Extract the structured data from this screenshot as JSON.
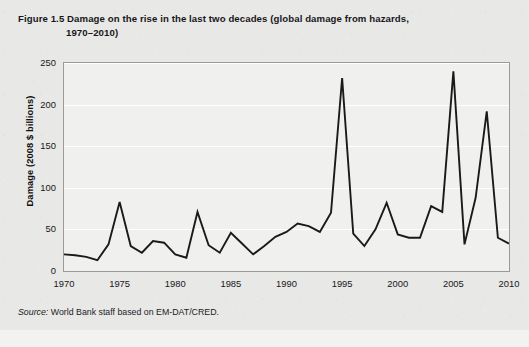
{
  "figure": {
    "number": "Figure 1.5",
    "title_line1": "Damage on the rise in the last two decades (global damage from hazards,",
    "title_line2": "1970–2010)",
    "source_label": "Source:",
    "source_text": " World Bank staff based on EM-DAT/CRED."
  },
  "colors": {
    "page_background": "#e8e8e6",
    "plot_background": "#f0f0ee",
    "line": "#1a1a1a",
    "gridline": "#ffffff",
    "frame": "#9a9a98",
    "text": "#17171a"
  },
  "chart_data": {
    "type": "line",
    "title": "Damage on the rise in the last two decades (global damage from hazards, 1970–2010)",
    "xlabel": "",
    "ylabel": "Damage (2008 $ billions)",
    "xlim": [
      1970,
      2010
    ],
    "ylim": [
      0,
      250
    ],
    "grid": true,
    "legend": "none",
    "yticks": [
      0,
      50,
      100,
      150,
      200,
      250
    ],
    "xticks": [
      1970,
      1975,
      1980,
      1985,
      1990,
      1995,
      2000,
      2005,
      2010
    ],
    "x": [
      1970,
      1971,
      1972,
      1973,
      1974,
      1975,
      1976,
      1977,
      1978,
      1979,
      1980,
      1981,
      1982,
      1983,
      1984,
      1985,
      1986,
      1987,
      1988,
      1989,
      1990,
      1991,
      1992,
      1993,
      1994,
      1995,
      1996,
      1997,
      1998,
      1999,
      2000,
      2001,
      2002,
      2003,
      2004,
      2005,
      2006,
      2007,
      2008,
      2009,
      2010
    ],
    "series": [
      {
        "name": "Global damage from hazards",
        "values": [
          20,
          19,
          17,
          13,
          32,
          83,
          30,
          22,
          36,
          34,
          20,
          16,
          71,
          31,
          22,
          46,
          33,
          20,
          30,
          41,
          47,
          57,
          54,
          47,
          70,
          232,
          45,
          30,
          50,
          82,
          44,
          40,
          40,
          78,
          71,
          240,
          32,
          88,
          192,
          40,
          33
        ]
      }
    ]
  }
}
